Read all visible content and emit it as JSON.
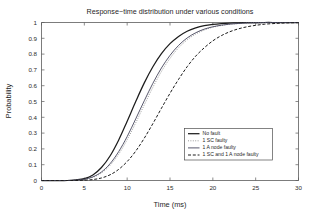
{
  "chart_data": {
    "type": "line",
    "title": "Response−time distribution under various conditions",
    "xlabel": "Time (ms)",
    "ylabel": "Probability",
    "xlim": [
      0,
      30
    ],
    "ylim": [
      0,
      1
    ],
    "grid": false,
    "legend_position": "lower-right-inside",
    "xticks": [
      0,
      5,
      10,
      15,
      20,
      25,
      30
    ],
    "xticklabels": [
      "0",
      "5",
      "10",
      "15",
      "20",
      "25",
      "30"
    ],
    "yticks": [
      0,
      0.1,
      0.2,
      0.3,
      0.4,
      0.5,
      0.6,
      0.7,
      0.8,
      0.9,
      1
    ],
    "yticklabels": [
      "0",
      "0.1",
      "0.2",
      "0.3",
      "0.4",
      "0.5",
      "0.6",
      "0.7",
      "0.8",
      "0.9",
      "1"
    ],
    "x": [
      0,
      1,
      2,
      3,
      4,
      5,
      6,
      7,
      8,
      9,
      10,
      11,
      12,
      13,
      14,
      15,
      16,
      17,
      18,
      19,
      20,
      21,
      22,
      23,
      24,
      25,
      26,
      27,
      28,
      29,
      30
    ],
    "series": [
      {
        "name": "No fault",
        "color": "#1c1c1c",
        "style": "solid",
        "width": 1.25,
        "dash": "",
        "values": [
          0,
          0,
          0,
          0,
          0.004,
          0.012,
          0.035,
          0.082,
          0.155,
          0.255,
          0.375,
          0.5,
          0.618,
          0.72,
          0.803,
          0.866,
          0.912,
          0.945,
          0.966,
          0.98,
          0.988,
          0.993,
          0.996,
          0.998,
          0.999,
          0.9995,
          1,
          1,
          1,
          1,
          1
        ]
      },
      {
        "name": "1 SC faulty",
        "color": "#9a9a9a",
        "style": "dotted",
        "width": 1.0,
        "dash": "1,1.4",
        "values": [
          0,
          0,
          0,
          0,
          0.002,
          0.007,
          0.02,
          0.048,
          0.096,
          0.166,
          0.258,
          0.365,
          0.479,
          0.59,
          0.69,
          0.773,
          0.84,
          0.89,
          0.927,
          0.952,
          0.97,
          0.981,
          0.989,
          0.993,
          0.996,
          0.998,
          0.999,
          1,
          1,
          1,
          1
        ]
      },
      {
        "name": "1 A node faulty",
        "color": "#3a3a52",
        "style": "solid",
        "width": 0.85,
        "dash": "",
        "values": [
          0,
          0,
          0,
          0,
          0.002,
          0.008,
          0.023,
          0.054,
          0.106,
          0.182,
          0.278,
          0.39,
          0.505,
          0.615,
          0.712,
          0.792,
          0.855,
          0.902,
          0.935,
          0.958,
          0.973,
          0.983,
          0.99,
          0.994,
          0.997,
          0.998,
          0.999,
          1,
          1,
          1,
          1
        ]
      },
      {
        "name": "1 SC and 1 A node faulty",
        "color": "#1c1c1c",
        "style": "dashed",
        "width": 1.0,
        "dash": "3,1.8",
        "values": [
          0,
          0,
          0,
          0,
          0,
          0.002,
          0.006,
          0.016,
          0.036,
          0.07,
          0.12,
          0.186,
          0.268,
          0.36,
          0.457,
          0.552,
          0.64,
          0.72,
          0.787,
          0.84,
          0.884,
          0.917,
          0.942,
          0.96,
          0.973,
          0.982,
          0.989,
          0.993,
          0.996,
          0.998,
          0.999
        ]
      }
    ],
    "legend_entries": [
      {
        "label": "No fault",
        "color": "#1c1c1c",
        "dash": "",
        "width": 1.25
      },
      {
        "label": "1 SC faulty",
        "color": "#9a9a9a",
        "dash": "1,1.4",
        "width": 1.0
      },
      {
        "label": "1 A node faulty",
        "color": "#3a3a52",
        "dash": "",
        "width": 0.85
      },
      {
        "label": "1 SC and 1 A node faulty",
        "color": "#1c1c1c",
        "dash": "3,1.8",
        "width": 1.0
      }
    ]
  }
}
